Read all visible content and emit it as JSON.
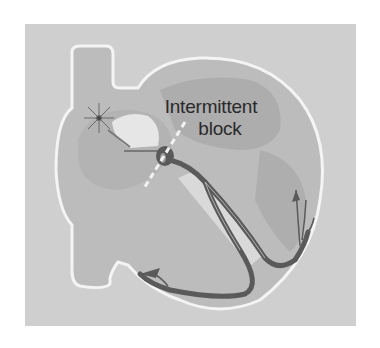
{
  "diagram": {
    "label": {
      "line1": "Intermittent",
      "line2": "block"
    },
    "elements": [
      "sinoatrial-node",
      "atrioventricular-node",
      "bundle-of-his",
      "left-bundle-branch",
      "right-bundle-branch",
      "purkinje-fibers",
      "block-dashed-line"
    ],
    "colors": {
      "background": "#cfcfcf",
      "heart_fill": "#b8b8b8",
      "outline": "#f4f4f4",
      "conduction": "#5a5a5a",
      "text": "#2a2a2a"
    }
  }
}
